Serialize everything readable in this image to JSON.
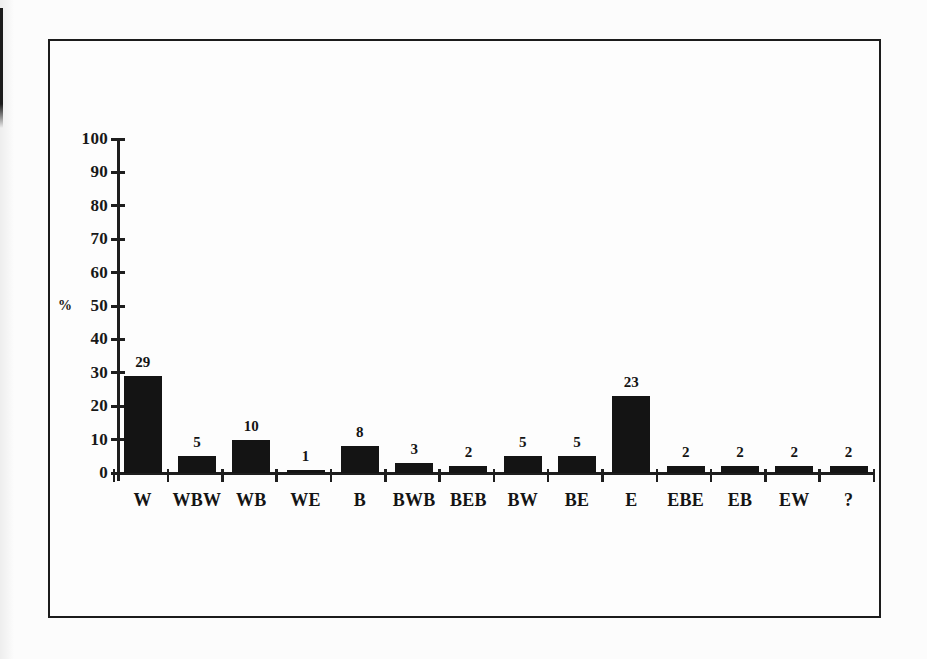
{
  "figure": {
    "kind": "scanned-bar-chart",
    "background_color": "#fcfcfc",
    "frame_border_color": "#1c1c1c",
    "ink_color": "#141414"
  },
  "chart_data": {
    "type": "bar",
    "title": "",
    "xlabel": "",
    "ylabel": "%",
    "categories": [
      "W",
      "WBW",
      "WB",
      "WE",
      "B",
      "BWB",
      "BEB",
      "BW",
      "BE",
      "E",
      "EBE",
      "EB",
      "EW",
      "?"
    ],
    "values": [
      29,
      5,
      10,
      1,
      8,
      3,
      2,
      5,
      5,
      23,
      2,
      2,
      2,
      2
    ],
    "value_labels": [
      "29",
      "5",
      "10",
      "1",
      "8",
      "3",
      "2",
      "5",
      "5",
      "23",
      "2",
      "2",
      "2",
      "2"
    ],
    "ylim": [
      0,
      100
    ],
    "ytick_labels": [
      "0",
      "10",
      "20",
      "30",
      "40",
      "50",
      "60",
      "70",
      "80",
      "90",
      "100"
    ],
    "grid": false,
    "legend": null,
    "bar_color": "#141414"
  }
}
